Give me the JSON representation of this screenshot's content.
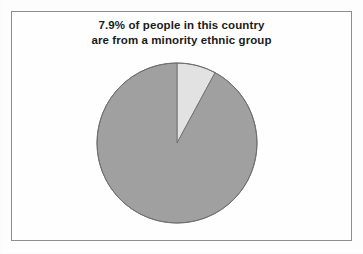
{
  "figure": {
    "background_color": "#fdfdfd",
    "frame_border_color": "#8d8d8d",
    "title_line_1": "7.9% of people in this country",
    "title_line_2": "are from a minority ethnic group",
    "title_color": "#1b1b1b"
  },
  "chart_data": {
    "type": "pie",
    "title": "7.9% of people in this country are from a minority ethnic group",
    "subtitle": "",
    "xlabel": "",
    "ylabel": "",
    "legend": "none",
    "grid": false,
    "labels": [
      "Minority ethnic group",
      "Not from a minority ethnic group"
    ],
    "values": [
      7.9,
      92.1
    ],
    "units": "percent",
    "total": 100,
    "start_angle_deg": 0,
    "direction": "clockwise",
    "slices": [
      {
        "label": "Minority ethnic group",
        "value": 7.9,
        "percent": "7.9%",
        "color": "#e2e2e2",
        "stroke": "#6f6f6f",
        "start_angle_deg": 0,
        "end_angle_deg": 28.44,
        "exploded": false
      },
      {
        "label": "Not from a minority ethnic group",
        "value": 92.1,
        "percent": "92.1%",
        "color": "#a0a0a0",
        "stroke": "#6f6f6f",
        "start_angle_deg": 28.44,
        "end_angle_deg": 360,
        "exploded": false
      }
    ],
    "geometry": {
      "center_x": 86,
      "center_y": 86,
      "radius": 80
    }
  }
}
